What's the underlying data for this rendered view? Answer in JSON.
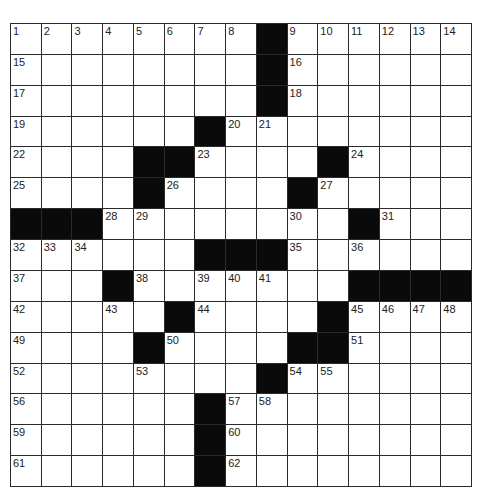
{
  "puzzle": {
    "size": {
      "rows": 15,
      "cols": 15
    },
    "grid": [
      "........#......",
      "........#......",
      "........#......",
      "......#........",
      "....##....#....",
      "....#....#.....",
      "###........#...",
      "......###......",
      "...#.......####",
      ".....#....#....",
      "....#....##....",
      "........#......",
      "......#........",
      "......#........",
      "......#........"
    ],
    "numbers": [
      {
        "n": 1,
        "r": 0,
        "c": 0
      },
      {
        "n": 2,
        "r": 0,
        "c": 1
      },
      {
        "n": 3,
        "r": 0,
        "c": 2
      },
      {
        "n": 4,
        "r": 0,
        "c": 3
      },
      {
        "n": 5,
        "r": 0,
        "c": 4
      },
      {
        "n": 6,
        "r": 0,
        "c": 5
      },
      {
        "n": 7,
        "r": 0,
        "c": 6
      },
      {
        "n": 8,
        "r": 0,
        "c": 7
      },
      {
        "n": 9,
        "r": 0,
        "c": 9
      },
      {
        "n": 10,
        "r": 0,
        "c": 10
      },
      {
        "n": 11,
        "r": 0,
        "c": 11
      },
      {
        "n": 12,
        "r": 0,
        "c": 12
      },
      {
        "n": 13,
        "r": 0,
        "c": 13
      },
      {
        "n": 14,
        "r": 0,
        "c": 14
      },
      {
        "n": 15,
        "r": 1,
        "c": 0
      },
      {
        "n": 16,
        "r": 1,
        "c": 9
      },
      {
        "n": 17,
        "r": 2,
        "c": 0
      },
      {
        "n": 18,
        "r": 2,
        "c": 9
      },
      {
        "n": 19,
        "r": 3,
        "c": 0
      },
      {
        "n": 20,
        "r": 3,
        "c": 7
      },
      {
        "n": 21,
        "r": 3,
        "c": 8
      },
      {
        "n": 22,
        "r": 4,
        "c": 0
      },
      {
        "n": 23,
        "r": 4,
        "c": 6
      },
      {
        "n": 24,
        "r": 4,
        "c": 11
      },
      {
        "n": 25,
        "r": 5,
        "c": 0
      },
      {
        "n": 26,
        "r": 5,
        "c": 5
      },
      {
        "n": 27,
        "r": 5,
        "c": 10
      },
      {
        "n": 28,
        "r": 6,
        "c": 3
      },
      {
        "n": 29,
        "r": 6,
        "c": 4
      },
      {
        "n": 30,
        "r": 6,
        "c": 9
      },
      {
        "n": 31,
        "r": 6,
        "c": 12
      },
      {
        "n": 32,
        "r": 7,
        "c": 0
      },
      {
        "n": 33,
        "r": 7,
        "c": 1
      },
      {
        "n": 34,
        "r": 7,
        "c": 2
      },
      {
        "n": 35,
        "r": 7,
        "c": 9
      },
      {
        "n": 36,
        "r": 7,
        "c": 11
      },
      {
        "n": 37,
        "r": 8,
        "c": 0
      },
      {
        "n": 38,
        "r": 8,
        "c": 4
      },
      {
        "n": 39,
        "r": 8,
        "c": 6
      },
      {
        "n": 40,
        "r": 8,
        "c": 7
      },
      {
        "n": 41,
        "r": 8,
        "c": 8
      },
      {
        "n": 42,
        "r": 9,
        "c": 0
      },
      {
        "n": 43,
        "r": 9,
        "c": 3
      },
      {
        "n": 44,
        "r": 9,
        "c": 6
      },
      {
        "n": 45,
        "r": 9,
        "c": 11
      },
      {
        "n": 46,
        "r": 9,
        "c": 12
      },
      {
        "n": 47,
        "r": 9,
        "c": 13
      },
      {
        "n": 48,
        "r": 9,
        "c": 14
      },
      {
        "n": 49,
        "r": 10,
        "c": 0
      },
      {
        "n": 50,
        "r": 10,
        "c": 5
      },
      {
        "n": 51,
        "r": 10,
        "c": 11
      },
      {
        "n": 52,
        "r": 11,
        "c": 0
      },
      {
        "n": 53,
        "r": 11,
        "c": 4
      },
      {
        "n": 54,
        "r": 11,
        "c": 9
      },
      {
        "n": 55,
        "r": 11,
        "c": 10
      },
      {
        "n": 56,
        "r": 12,
        "c": 0
      },
      {
        "n": 57,
        "r": 12,
        "c": 7
      },
      {
        "n": 58,
        "r": 12,
        "c": 8
      },
      {
        "n": 59,
        "r": 13,
        "c": 0
      },
      {
        "n": 60,
        "r": 13,
        "c": 7
      },
      {
        "n": 61,
        "r": 14,
        "c": 0
      },
      {
        "n": 62,
        "r": 14,
        "c": 7
      }
    ]
  },
  "colors": {
    "block": "#0a0a0a",
    "line": "#2a2a2a",
    "cell": "#ffffff"
  }
}
